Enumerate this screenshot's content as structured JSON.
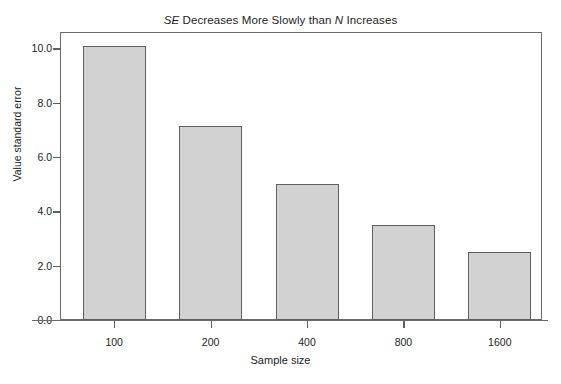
{
  "chart_data": {
    "type": "bar",
    "title": "SE Decreases More Slowly than N Increases",
    "title_parts": {
      "italic_1": "SE",
      "plain_1": " Decreases More Slowly than ",
      "italic_2": "N",
      "plain_2": " Increases"
    },
    "xlabel": "Sample size",
    "ylabel": "Value standard error",
    "categories": [
      "100",
      "200",
      "400",
      "800",
      "1600"
    ],
    "values": [
      10.1,
      7.15,
      5.0,
      3.5,
      2.5
    ],
    "ylim": [
      0.0,
      10.6
    ],
    "ytick_labels": [
      "0.0",
      "2.0",
      "4.0",
      "6.0",
      "8.0",
      "10.0"
    ],
    "ytick_values": [
      0.0,
      2.0,
      4.0,
      6.0,
      8.0,
      10.0
    ],
    "grid": false,
    "legend": null,
    "colors": {
      "bar_fill": "#d2d2d2",
      "bar_border": "#5e5e5e",
      "frame": "#6a6a6a",
      "text": "#1d1d1d",
      "background": "#ffffff"
    }
  }
}
